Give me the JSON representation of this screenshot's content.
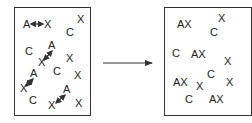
{
  "left_panel": {
    "labels": [
      {
        "text": "A",
        "x": 23,
        "y": 19
      },
      {
        "text": "X",
        "x": 44,
        "y": 19
      },
      {
        "text": "X",
        "x": 77,
        "y": 14
      },
      {
        "text": "C",
        "x": 66,
        "y": 27
      },
      {
        "text": "C",
        "x": 25,
        "y": 46
      },
      {
        "text": "A",
        "x": 48,
        "y": 40
      },
      {
        "text": "X",
        "x": 38,
        "y": 57
      },
      {
        "text": "X",
        "x": 66,
        "y": 53
      },
      {
        "text": "C",
        "x": 53,
        "y": 66
      },
      {
        "text": "A",
        "x": 30,
        "y": 68
      },
      {
        "text": "X",
        "x": 20,
        "y": 83
      },
      {
        "text": "X",
        "x": 74,
        "y": 70
      },
      {
        "text": "C",
        "x": 29,
        "y": 95
      },
      {
        "text": "A",
        "x": 63,
        "y": 84
      },
      {
        "text": "X",
        "x": 48,
        "y": 100
      },
      {
        "text": "X",
        "x": 75,
        "y": 98
      }
    ],
    "arrows": [
      {
        "type": "double",
        "x1": 31,
        "y1": 24,
        "x2": 43,
        "y2": 24
      },
      {
        "type": "double",
        "x1": 52,
        "y1": 51,
        "x2": 44,
        "y2": 60
      },
      {
        "type": "double",
        "x1": 33,
        "y1": 79,
        "x2": 26,
        "y2": 86
      },
      {
        "type": "double",
        "x1": 65,
        "y1": 95,
        "x2": 56,
        "y2": 103
      }
    ]
  },
  "right_panel": {
    "labels": [
      {
        "text": "AX",
        "x": 177,
        "y": 19
      },
      {
        "text": "X",
        "x": 218,
        "y": 13
      },
      {
        "text": "C",
        "x": 210,
        "y": 27
      },
      {
        "text": "C",
        "x": 172,
        "y": 48
      },
      {
        "text": "AX",
        "x": 191,
        "y": 49
      },
      {
        "text": "X",
        "x": 224,
        "y": 56
      },
      {
        "text": "C",
        "x": 207,
        "y": 69
      },
      {
        "text": "AX",
        "x": 173,
        "y": 77
      },
      {
        "text": "X",
        "x": 196,
        "y": 81
      },
      {
        "text": "X",
        "x": 226,
        "y": 77
      },
      {
        "text": "C",
        "x": 185,
        "y": 94
      },
      {
        "text": "AX",
        "x": 209,
        "y": 94
      }
    ]
  },
  "transition_arrow": {
    "x1": 103,
    "y1": 63,
    "x2": 152,
    "y2": 63
  },
  "colors": {
    "ink": "#333333",
    "background": "#ffffff"
  }
}
